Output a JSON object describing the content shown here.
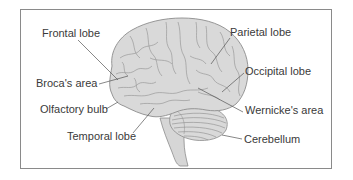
{
  "diagram": {
    "colors": {
      "brain_fill": "#d9d9d9",
      "outline": "#8c8c8c",
      "sulci": "#9a9a9a",
      "leader_line": "#555555",
      "text": "#3a3a3a",
      "frame_border": "#8a8a8a"
    },
    "labels": {
      "frontal_lobe": "Frontal lobe",
      "brocas_area": "Broca's area",
      "olfactory_bulb": "Olfactory bulb",
      "temporal_lobe": "Temporal lobe",
      "parietal_lobe": "Parietal lobe",
      "occipital_lobe": "Occipital lobe",
      "wernickes_area": "Wernicke's area",
      "cerebellum": "Cerebellum"
    }
  }
}
